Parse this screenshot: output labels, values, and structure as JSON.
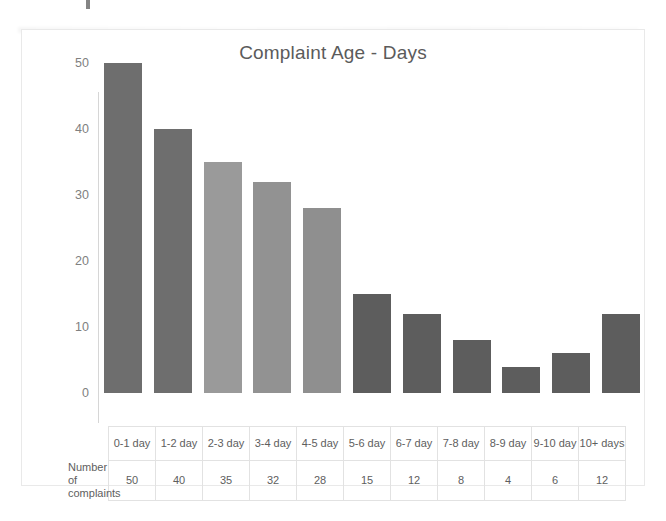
{
  "chart_data": {
    "type": "bar",
    "title": "Complaint Age - Days",
    "xlabel": "",
    "ylabel": "",
    "ylim": [
      0,
      50
    ],
    "yticks": [
      50,
      40,
      30,
      20,
      10,
      0
    ],
    "grid": false,
    "legend": "none",
    "row_label": "Number of complaints",
    "categories": [
      "0-1 day",
      "1-2 day",
      "2-3 day",
      "3-4 day",
      "4-5 day",
      "5-6 day",
      "6-7 day",
      "7-8 day",
      "8-9 day",
      "9-10 day",
      "10+ days"
    ],
    "values": [
      50,
      40,
      35,
      32,
      28,
      15,
      12,
      8,
      4,
      6,
      12
    ],
    "bar_colors": [
      "#6e6e6e",
      "#6e6e6e",
      "#9a9a9a",
      "#929292",
      "#8f8f8f",
      "#5d5d5d",
      "#5d5d5d",
      "#5d5d5d",
      "#5d5d5d",
      "#5d5d5d",
      "#5d5d5d"
    ]
  },
  "colors": {
    "title": "#5b5b5b",
    "axis_text": "#808080",
    "frame": "#e9e9e9",
    "table_border": "#e2e2e2",
    "background": "#ffffff"
  }
}
